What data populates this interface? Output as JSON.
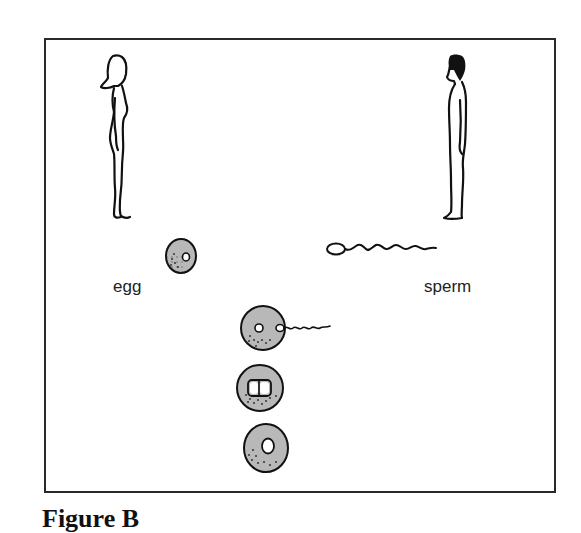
{
  "diagram": {
    "caption": "Figure B",
    "labels": {
      "egg": "egg",
      "sperm": "sperm"
    },
    "figures": {
      "female": "female-figure",
      "male": "male-figure"
    },
    "stages": [
      {
        "id": "egg",
        "description": "egg cell with single nucleus"
      },
      {
        "id": "sperm",
        "description": "sperm cell with head and wavy tail"
      },
      {
        "id": "fertilization",
        "description": "sperm entering egg, two nuclei"
      },
      {
        "id": "fusion",
        "description": "two nuclei adjacent"
      },
      {
        "id": "zygote",
        "description": "fertilized cell with single fused nucleus"
      }
    ],
    "colors": {
      "cell_fill": "#b8b8b8",
      "outline": "#1a1a1a",
      "frame": "#2a2a2a",
      "background": "#ffffff"
    }
  }
}
